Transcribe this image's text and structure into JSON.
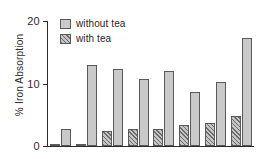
{
  "chart_data": {
    "type": "bar",
    "title": "",
    "xlabel": "",
    "ylabel": "% Iron Absorption",
    "ylim": [
      0,
      20
    ],
    "yticks": [
      0,
      10,
      20
    ],
    "ytick_labels": [
      "0",
      "10",
      "20"
    ],
    "grid": false,
    "legend_position": "top-left",
    "categories": [
      "1",
      "2",
      "3",
      "4",
      "5",
      "6",
      "7",
      "8"
    ],
    "xtick_labels": [
      "",
      "",
      "",
      "",
      "",
      "",
      "",
      ""
    ],
    "series": [
      {
        "name": "with tea",
        "values": [
          0.4,
          0.2,
          2.4,
          2.8,
          2.8,
          3.4,
          3.7,
          4.8
        ]
      },
      {
        "name": "without tea",
        "values": [
          2.7,
          13.0,
          12.4,
          10.8,
          12.0,
          8.6,
          10.2,
          17.3
        ]
      }
    ]
  },
  "legend": {
    "items": [
      {
        "label": "without tea",
        "fill": "plain"
      },
      {
        "label": "with tea",
        "fill": "hatch"
      }
    ]
  },
  "axis": {
    "y_title": "% Iron Absorption",
    "ticks": [
      "20",
      "10",
      "0"
    ]
  },
  "colors": {
    "bar_plain": "#c9c9c9",
    "bar_hatch": "#c4c4c4",
    "outline": "#5a5a5a",
    "axis": "#2b2b2b",
    "background": "#ffffff"
  }
}
